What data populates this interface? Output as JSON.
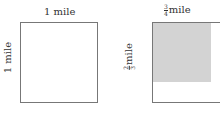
{
  "left": {
    "top_label": "1 mile",
    "side_label": "1 mile"
  },
  "right": {
    "top_num": "3",
    "top_den": "4",
    "top_unit": "mile",
    "side_num": "2",
    "side_den": "3",
    "side_unit": "mile",
    "shade_color": "#d3d3d3"
  }
}
